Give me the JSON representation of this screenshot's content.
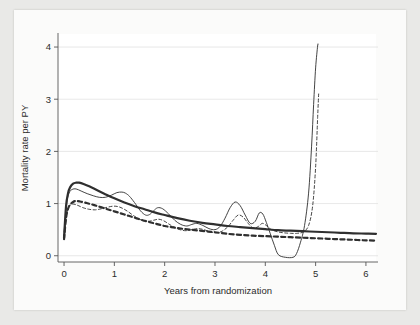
{
  "figure": {
    "name": "mortality-rate-figure",
    "background_color": "#e9e9e7",
    "card_color": "#fbfbfa"
  },
  "chart_data": {
    "type": "line",
    "title": "",
    "subtitle": "",
    "xlabel": "Years from randomization",
    "ylabel": "Mortality rate per PY",
    "xlim": [
      -0.12,
      6.2
    ],
    "ylim": [
      -0.12,
      4.25
    ],
    "xticks": [
      0,
      1,
      2,
      3,
      4,
      5,
      6
    ],
    "xticklabels": [
      "0",
      "1",
      "2",
      "3",
      "4",
      "5",
      "6"
    ],
    "yticks": [
      0,
      1,
      2,
      3,
      4
    ],
    "yticklabels": [
      "0",
      "1",
      "2",
      "3",
      "4"
    ],
    "grid": "horizontal-faint",
    "legend": "none",
    "line_color": "#2f2f2f",
    "series": [
      {
        "name": "Smooth treatment (thick solid)",
        "style": "thick-solid",
        "x": [
          0.0,
          0.04,
          0.08,
          0.12,
          0.18,
          0.24,
          0.3,
          0.4,
          0.5,
          0.65,
          0.8,
          1.0,
          1.2,
          1.4,
          1.6,
          1.8,
          2.0,
          2.25,
          2.5,
          2.75,
          3.0,
          3.25,
          3.5,
          3.75,
          4.0,
          4.25,
          4.5,
          4.75,
          5.0,
          5.25,
          5.5,
          5.75,
          6.0,
          6.2
        ],
        "y": [
          0.34,
          0.95,
          1.2,
          1.31,
          1.38,
          1.4,
          1.4,
          1.37,
          1.33,
          1.26,
          1.19,
          1.1,
          1.02,
          0.95,
          0.89,
          0.83,
          0.78,
          0.72,
          0.67,
          0.63,
          0.6,
          0.57,
          0.55,
          0.53,
          0.51,
          0.49,
          0.48,
          0.47,
          0.46,
          0.45,
          0.44,
          0.43,
          0.425,
          0.42
        ]
      },
      {
        "name": "Smooth control (thick dashed)",
        "style": "thick-dashed",
        "x": [
          0.0,
          0.04,
          0.08,
          0.12,
          0.18,
          0.24,
          0.32,
          0.45,
          0.6,
          0.8,
          1.0,
          1.2,
          1.4,
          1.6,
          1.8,
          2.0,
          2.2,
          2.4,
          2.6,
          2.8,
          3.0,
          3.25,
          3.5,
          3.75,
          4.0,
          4.25,
          4.5,
          4.75,
          5.0,
          5.25,
          5.5,
          5.75,
          6.0,
          6.2
        ],
        "y": [
          0.32,
          0.72,
          0.9,
          0.98,
          1.03,
          1.05,
          1.04,
          1.01,
          0.97,
          0.91,
          0.85,
          0.79,
          0.73,
          0.67,
          0.62,
          0.57,
          0.54,
          0.51,
          0.49,
          0.47,
          0.45,
          0.42,
          0.4,
          0.385,
          0.375,
          0.365,
          0.355,
          0.345,
          0.335,
          0.325,
          0.315,
          0.305,
          0.295,
          0.29
        ]
      },
      {
        "name": "Kernel treatment (thin solid)",
        "style": "thin-solid",
        "x": [
          0.0,
          0.05,
          0.1,
          0.16,
          0.24,
          0.34,
          0.46,
          0.58,
          0.7,
          0.82,
          0.94,
          1.05,
          1.15,
          1.22,
          1.3,
          1.4,
          1.52,
          1.62,
          1.7,
          1.78,
          1.86,
          1.96,
          2.08,
          2.2,
          2.32,
          2.44,
          2.54,
          2.64,
          2.76,
          2.88,
          3.0,
          3.1,
          3.2,
          3.3,
          3.4,
          3.5,
          3.6,
          3.7,
          3.8,
          3.88,
          3.95,
          4.02,
          4.1,
          4.18,
          4.26,
          4.4,
          4.55,
          4.62,
          4.7,
          4.78,
          4.86,
          4.92,
          4.96,
          5.0,
          5.04,
          5.05
        ],
        "y": [
          0.34,
          0.98,
          1.2,
          1.27,
          1.28,
          1.24,
          1.19,
          1.15,
          1.12,
          1.12,
          1.16,
          1.21,
          1.22,
          1.2,
          1.14,
          1.02,
          0.86,
          0.78,
          0.79,
          0.86,
          0.92,
          0.9,
          0.8,
          0.68,
          0.6,
          0.57,
          0.6,
          0.62,
          0.58,
          0.52,
          0.5,
          0.56,
          0.72,
          0.92,
          1.03,
          0.96,
          0.78,
          0.62,
          0.66,
          0.82,
          0.8,
          0.64,
          0.42,
          0.2,
          0.02,
          -0.03,
          -0.03,
          0.04,
          0.26,
          0.58,
          1.2,
          2.1,
          2.9,
          3.6,
          4.02,
          4.05
        ]
      },
      {
        "name": "Kernel control (thin dashed)",
        "style": "thin-dashed",
        "x": [
          0.0,
          0.05,
          0.1,
          0.17,
          0.26,
          0.38,
          0.5,
          0.62,
          0.74,
          0.86,
          0.98,
          1.08,
          1.18,
          1.28,
          1.38,
          1.48,
          1.58,
          1.68,
          1.78,
          1.88,
          1.98,
          2.08,
          2.18,
          2.3,
          2.42,
          2.54,
          2.66,
          2.78,
          2.9,
          3.02,
          3.14,
          3.26,
          3.36,
          3.46,
          3.56,
          3.66,
          3.76,
          3.86,
          3.94,
          4.02,
          4.12,
          4.24,
          4.36,
          4.5,
          4.64,
          4.76,
          4.86,
          4.94,
          5.0,
          5.04,
          5.06
        ],
        "y": [
          0.31,
          0.78,
          0.94,
          0.99,
          0.97,
          0.92,
          0.89,
          0.88,
          0.9,
          0.93,
          0.95,
          0.94,
          0.9,
          0.84,
          0.77,
          0.71,
          0.67,
          0.66,
          0.68,
          0.7,
          0.67,
          0.61,
          0.55,
          0.5,
          0.48,
          0.5,
          0.52,
          0.5,
          0.46,
          0.44,
          0.47,
          0.56,
          0.68,
          0.78,
          0.74,
          0.62,
          0.53,
          0.56,
          0.62,
          0.58,
          0.5,
          0.46,
          0.44,
          0.43,
          0.43,
          0.46,
          0.58,
          0.95,
          1.7,
          2.65,
          3.1
        ]
      }
    ]
  }
}
